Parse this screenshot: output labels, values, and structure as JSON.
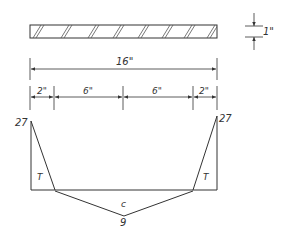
{
  "beam": {
    "length_label": "16\"",
    "depth_label": "1\""
  },
  "segments": {
    "labels": [
      "2\"",
      "6\"",
      "6\"",
      "2\""
    ]
  },
  "stress_diagram": {
    "left_peak": "27",
    "right_peak": "27",
    "left_zone": "T",
    "right_zone": "T",
    "center_zone": "c",
    "center_value": "9"
  },
  "colors": {
    "line": "#333333",
    "background": "#ffffff"
  }
}
